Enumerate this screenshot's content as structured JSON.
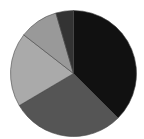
{
  "chart_data": {
    "type": "pie",
    "title": "",
    "legend": null,
    "center": [
      73.5,
      73.5
    ],
    "radius": 63,
    "start_angle_deg": 0,
    "direction": "clockwise",
    "slices": [
      {
        "label": "",
        "value": 37.5,
        "color": "#111111"
      },
      {
        "label": "",
        "value": 29.0,
        "color": "#555555"
      },
      {
        "label": "",
        "value": 19.0,
        "color": "#aaaaaa"
      },
      {
        "label": "",
        "value": 10.0,
        "color": "#999999"
      },
      {
        "label": "",
        "value": 4.5,
        "color": "#333333"
      }
    ]
  }
}
